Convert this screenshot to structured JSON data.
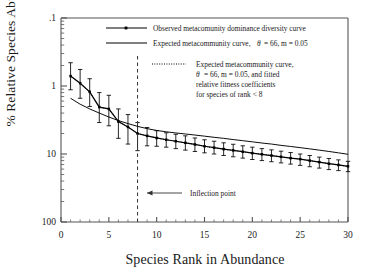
{
  "chart_data": {
    "type": "line",
    "title": "",
    "xlabel": "Species Rank in Abundance",
    "ylabel": "% Relative Species Abundance",
    "xlim": [
      0,
      30
    ],
    "ylim": [
      0.1,
      100
    ],
    "yscale": "log",
    "xscale": "linear",
    "grid": false,
    "legend_position": "top-right-inside",
    "xticks": [
      "0",
      "5",
      "10",
      "15",
      "20",
      "25",
      "30"
    ],
    "xtick_values": [
      0,
      5,
      10,
      15,
      20,
      25,
      30
    ],
    "yticks": [
      ".1",
      "1",
      "10",
      "100"
    ],
    "ytick_values": [
      0.1,
      1,
      10,
      100
    ],
    "x": [
      1,
      2,
      3,
      4,
      5,
      6,
      7,
      8,
      9,
      10,
      11,
      12,
      13,
      14,
      15,
      16,
      17,
      18,
      19,
      20,
      21,
      22,
      23,
      24,
      25,
      26,
      27,
      28,
      29,
      30
    ],
    "series": [
      {
        "name": "Observed metacomunity dominance diversity curve",
        "style": "line-markers-errorbars",
        "marker": "square",
        "values": [
          14.0,
          11.0,
          8.2,
          4.9,
          4.6,
          3.0,
          2.5,
          2.0,
          1.85,
          1.72,
          1.62,
          1.54,
          1.46,
          1.38,
          1.3,
          1.24,
          1.18,
          1.13,
          1.08,
          1.03,
          0.99,
          0.95,
          0.91,
          0.87,
          0.84,
          0.8,
          0.76,
          0.72,
          0.69,
          0.66
        ],
        "err_upper": [
          22.0,
          17.5,
          12.8,
          8.0,
          7.3,
          4.6,
          3.8,
          2.9,
          2.45,
          2.2,
          2.05,
          1.95,
          1.85,
          1.72,
          1.62,
          1.54,
          1.46,
          1.39,
          1.32,
          1.26,
          1.2,
          1.15,
          1.1,
          1.05,
          1.0,
          0.95,
          0.9,
          0.86,
          0.82,
          0.78
        ],
        "err_lower": [
          8.8,
          6.6,
          5.0,
          2.9,
          2.6,
          1.7,
          1.4,
          1.12,
          1.32,
          1.3,
          1.26,
          1.2,
          1.14,
          1.09,
          1.04,
          1.0,
          0.95,
          0.91,
          0.87,
          0.83,
          0.8,
          0.77,
          0.74,
          0.71,
          0.68,
          0.65,
          0.62,
          0.59,
          0.57,
          0.55
        ]
      },
      {
        "name": "Expected metacommunity curve,",
        "style": "solid-line",
        "theta": 66,
        "m": 0.05,
        "values": [
          6.6,
          5.4,
          4.6,
          4.0,
          3.5,
          3.1,
          2.8,
          2.55,
          2.36,
          2.22,
          2.12,
          2.04,
          1.97,
          1.9,
          1.83,
          1.76,
          1.7,
          1.63,
          1.57,
          1.51,
          1.45,
          1.4,
          1.34,
          1.29,
          1.24,
          1.19,
          1.14,
          1.09,
          1.04,
          0.99
        ]
      },
      {
        "name": "Expected metacommunity curve, with fitted relative fitness coefficients for species of rank < 8",
        "style": "dotted-line",
        "theta": 66,
        "m": 0.05,
        "values": [
          14.0,
          11.0,
          8.2,
          4.9,
          4.6,
          3.0,
          2.5,
          2.0,
          1.85,
          1.72,
          1.62,
          1.54,
          1.46,
          1.38,
          1.3,
          1.24,
          1.18,
          1.13,
          1.08,
          1.03,
          0.99,
          0.95,
          0.91,
          0.87,
          0.84,
          0.8,
          0.76,
          0.72,
          0.69,
          0.66
        ]
      }
    ],
    "annotations": [
      {
        "label": "Inflection point",
        "x": 8,
        "type": "arrow-left",
        "note": "vertical dashed line at species rank 8"
      }
    ],
    "vline": {
      "x": 8,
      "style": "dashed"
    }
  },
  "legend": {
    "entries": [
      {
        "id": "observed",
        "sample": "line-with-square-marker",
        "text": "Observed metacomunity dominance diversity curve"
      },
      {
        "id": "expected",
        "sample": "solid-line",
        "text_before": "Expected metacommunity curve,",
        "theta_symbol": "θ",
        "params": "= 66, m = 0.05"
      },
      {
        "id": "expected-fitted",
        "sample": "dotted-line",
        "line1": "Expected metacommunity curve,",
        "theta_symbol": "θ",
        "line2_params": "= 66,  m = 0.05, and fitted",
        "line3": "relative fitness coefficients",
        "line4": "for species of rank < 8"
      }
    ]
  },
  "axes": {
    "xlabel": "Species Rank in Abundance",
    "ylabel": "% Relative Species Abundance",
    "xticks": [
      "0",
      "5",
      "10",
      "15",
      "20",
      "25",
      "30"
    ],
    "yticks": [
      "100",
      "10",
      "1",
      ".1"
    ]
  },
  "annotation": {
    "inflection_label": "Inflection point"
  },
  "colors": {
    "line": "#000000",
    "background": "#ffffff",
    "axis": "#555555",
    "text": "#1a1a1a"
  }
}
